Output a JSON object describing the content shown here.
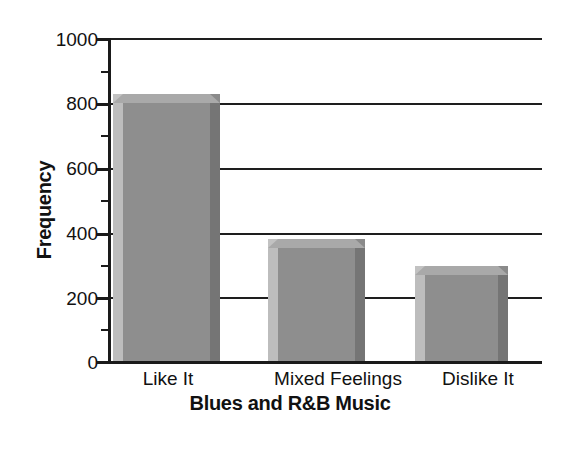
{
  "chart_data": {
    "type": "bar",
    "title": "",
    "xlabel": "Blues and R&B Music",
    "ylabel": "Frequency",
    "categories": [
      "Like It",
      "Mixed Feelings",
      "Dislike It"
    ],
    "values": [
      800,
      350,
      265
    ],
    "ylim": [
      0,
      1000
    ],
    "ytick_labels": [
      "0",
      "200",
      "400",
      "600",
      "800",
      "1000"
    ],
    "ytick_values": [
      0,
      200,
      400,
      600,
      800,
      1000
    ],
    "yminor_ticks": [
      100,
      300,
      500,
      700,
      900
    ],
    "grid": "horizontal",
    "legend": "none",
    "bar_style": "3d-shaded-gray",
    "colors": {
      "bar_face": "#8e8e8e",
      "bar_left": "#bdbdbd",
      "bar_right": "#757575",
      "bar_top": "#a9a9a9",
      "axis": "#1a1a1a",
      "background": "#ffffff",
      "text": "#111111"
    }
  },
  "axes": {
    "y_title": "Frequency",
    "x_title": "Blues and R&B Music"
  },
  "ticks": {
    "t0": "0",
    "t1": "200",
    "t2": "400",
    "t3": "600",
    "t4": "800",
    "t5": "1000"
  },
  "categories": {
    "c0": "Like It",
    "c1": "Mixed Feelings",
    "c2": "Dislike It"
  }
}
